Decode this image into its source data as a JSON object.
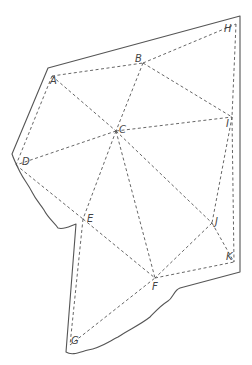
{
  "diagram": {
    "type": "triangulated-polygon",
    "colors": {
      "stroke": "#555555",
      "label": "#444444",
      "background": "#ffffff"
    },
    "vertices": [
      {
        "id": "A",
        "label": "A",
        "x": 52,
        "y": 76,
        "lx": 50,
        "ly": 84
      },
      {
        "id": "B",
        "label": "B",
        "x": 143,
        "y": 63,
        "lx": 135,
        "ly": 62
      },
      {
        "id": "H",
        "label": "H",
        "x": 236,
        "y": 24,
        "lx": 224,
        "ly": 32
      },
      {
        "id": "C",
        "label": "C",
        "x": 116,
        "y": 131,
        "lx": 119,
        "ly": 133
      },
      {
        "id": "I",
        "label": "I",
        "x": 232,
        "y": 117,
        "lx": 226,
        "ly": 127
      },
      {
        "id": "D",
        "label": "D",
        "x": 16,
        "y": 165,
        "lx": 22,
        "ly": 165
      },
      {
        "id": "E",
        "label": "E",
        "x": 83,
        "y": 219,
        "lx": 87,
        "ly": 222
      },
      {
        "id": "J",
        "label": "J",
        "x": 212,
        "y": 223,
        "lx": 215,
        "ly": 225
      },
      {
        "id": "K",
        "label": "K",
        "x": 234,
        "y": 262,
        "lx": 226,
        "ly": 260
      },
      {
        "id": "F",
        "label": "F",
        "x": 155,
        "y": 278,
        "lx": 152,
        "ly": 290
      },
      {
        "id": "G",
        "label": "G",
        "x": 70,
        "y": 345,
        "lx": 71,
        "ly": 344
      }
    ],
    "edges": [
      [
        "A",
        "B"
      ],
      [
        "B",
        "H"
      ],
      [
        "A",
        "C"
      ],
      [
        "B",
        "C"
      ],
      [
        "B",
        "I"
      ],
      [
        "H",
        "I"
      ],
      [
        "C",
        "I"
      ],
      [
        "A",
        "D"
      ],
      [
        "C",
        "D"
      ],
      [
        "D",
        "E"
      ],
      [
        "C",
        "E"
      ],
      [
        "C",
        "J"
      ],
      [
        "C",
        "F"
      ],
      [
        "I",
        "J"
      ],
      [
        "J",
        "F"
      ],
      [
        "J",
        "K"
      ],
      [
        "E",
        "F"
      ],
      [
        "E",
        "G"
      ],
      [
        "G",
        "F"
      ],
      [
        "F",
        "K"
      ],
      [
        "I",
        "K"
      ]
    ],
    "outline_path": "M48,68 L240,16 L240,272 L180,288 C174,290 173,298 168,301 C160,306 155,312 150,317 C140,325 128,330 118,337 C108,342 100,348 88,350 C80,352 72,356 66,352 L76,224 C70,226 64,230 58,228 C54,222 48,218 44,210 C40,204 36,200 32,192 C28,184 24,180 20,172 C16,164 14,160 12,154 Z"
  }
}
